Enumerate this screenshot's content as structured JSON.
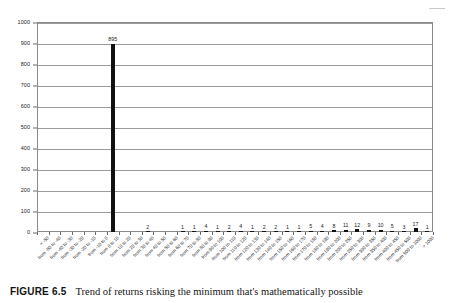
{
  "figure": {
    "number_label": "FIGURE 6.5",
    "caption": "Trend of returns risking the minimum that's mathematically possible"
  },
  "corner_mark": "page-edge-mark",
  "chart_data": {
    "type": "bar",
    "title": "",
    "subtitle": "",
    "xlabel": "",
    "ylabel": "",
    "ylim": [
      0,
      1000
    ],
    "ytick_step": 100,
    "yticks": [
      "0",
      "100",
      "200",
      "300",
      "400",
      "500",
      "600",
      "700",
      "800",
      "900",
      "1000"
    ],
    "grid": true,
    "grid_axis": "y",
    "legend": false,
    "legend_position": "none",
    "bar_color": "#111111",
    "data_labels": true,
    "categories": [
      "< -50",
      "from -50 to -40",
      "from -40 to -30",
      "from -30 to -20",
      "from -20 to -10",
      "from -10 to 0",
      "from 0 to 10",
      "from 10 to 20",
      "from 20 to 30",
      "from 30 to 40",
      "from 40 to 50",
      "from 50 to 60",
      "from 60 to 70",
      "from 70 to 80",
      "from 80 to 90",
      "from 90 to 100",
      "from 100 to 110",
      "from 110 to 120",
      "from 120 to 130",
      "from 130 to 140",
      "from 140 to 150",
      "from 150 to 160",
      "from 160 to 170",
      "from 170 to 180",
      "from 180 to 190",
      "from 190 to 200",
      "from 200 to 250",
      "from 250 to 300",
      "from 300 to 350",
      "from 350 to 400",
      "from 400 to 450",
      "from 450 to 500",
      "from 500 to 1000",
      "> 1000"
    ],
    "values": [
      0,
      0,
      0,
      0,
      0,
      0,
      895,
      0,
      0,
      2,
      0,
      0,
      1,
      1,
      4,
      1,
      2,
      4,
      1,
      2,
      2,
      1,
      1,
      5,
      4,
      8,
      11,
      12,
      9,
      10,
      5,
      3,
      17,
      1
    ],
    "visible_value_labels": [
      {
        "category": "from 0 to 10",
        "value": 895
      },
      {
        "category": "from 30 to 40",
        "value": 2
      },
      {
        "category": "from 60 to 70",
        "value": 1
      },
      {
        "category": "from 70 to 80",
        "value": 1
      },
      {
        "category": "from 80 to 90",
        "value": 4
      },
      {
        "category": "from 90 to 100",
        "value": 1
      },
      {
        "category": "from 100 to 110",
        "value": 2
      },
      {
        "category": "from 110 to 120",
        "value": 4
      },
      {
        "category": "from 120 to 130",
        "value": 1
      },
      {
        "category": "from 130 to 140",
        "value": 2
      },
      {
        "category": "from 140 to 150",
        "value": 2
      },
      {
        "category": "from 150 to 160",
        "value": 1
      },
      {
        "category": "from 160 to 170",
        "value": 1
      },
      {
        "category": "from 170 to 180",
        "value": 5
      },
      {
        "category": "from 180 to 190",
        "value": 4
      },
      {
        "category": "from 190 to 200",
        "value": 8
      },
      {
        "category": "from 200 to 250",
        "value": 11
      },
      {
        "category": "from 250 to 300",
        "value": 12
      },
      {
        "category": "from 300 to 350",
        "value": 9
      },
      {
        "category": "from 350 to 400",
        "value": 10
      },
      {
        "category": "from 400 to 450",
        "value": 5
      },
      {
        "category": "from 450 to 500",
        "value": 3
      },
      {
        "category": "from 500 to 1000",
        "value": 17
      },
      {
        "category": "> 1000",
        "value": 1
      }
    ]
  }
}
